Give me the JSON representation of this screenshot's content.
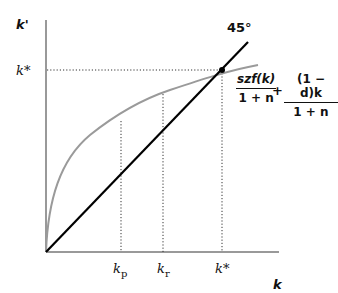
{
  "diagram": {
    "y_axis_label": "k'",
    "x_axis_label": "k",
    "y_tick_label": "k*",
    "line_label": "45°",
    "x_ticks": [
      {
        "label": "k",
        "sub": "p"
      },
      {
        "label": "k",
        "sub": "r"
      },
      {
        "label": "k*",
        "sub": ""
      }
    ],
    "formula": {
      "term1_num": "szf(k)",
      "term1_den": "1 + n",
      "operator": "+",
      "term2_num": "(1 − d)k",
      "term2_den": "1 + n"
    },
    "colors": {
      "axes": "#777777",
      "curve": "#9a9a9a",
      "line45": "#000000",
      "guides": "#333333"
    }
  }
}
